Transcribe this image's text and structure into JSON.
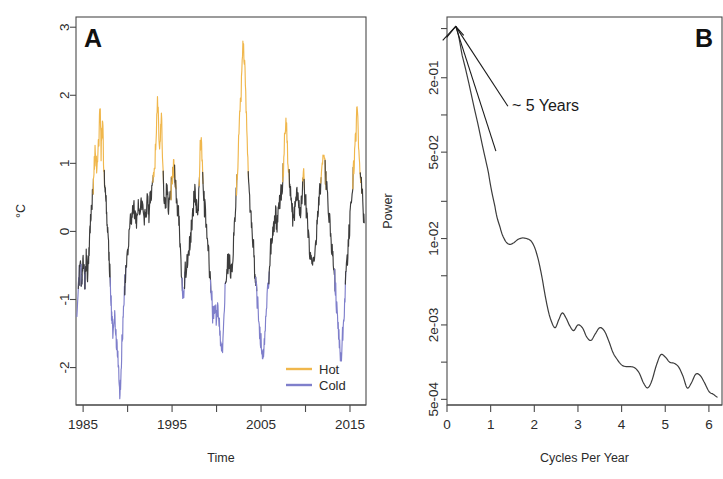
{
  "figure": {
    "background": "#ffffff",
    "width": 723,
    "height": 479
  },
  "panelA": {
    "letter": "A",
    "ylabel": "°C",
    "xlabel": "Time",
    "colors": {
      "neutral": "#3c3c3c",
      "hot": "#F0B74C",
      "cold": "#7F7FCB"
    },
    "legend": {
      "items": [
        {
          "label": "Hot",
          "color": "#F0B74C"
        },
        {
          "label": "Cold",
          "color": "#7F7FCB"
        }
      ]
    },
    "yticks": [
      {
        "value": 3,
        "label": "3"
      },
      {
        "value": 2,
        "label": "2"
      },
      {
        "value": 1,
        "label": "1"
      },
      {
        "value": 0,
        "label": "0"
      },
      {
        "value": -1,
        "label": "-1"
      },
      {
        "value": -2,
        "label": "-2"
      }
    ],
    "xticks": [
      {
        "value": 1985,
        "label": "1985"
      },
      {
        "value": 1990,
        "label": ""
      },
      {
        "value": 1995,
        "label": "1995"
      },
      {
        "value": 2000,
        "label": ""
      },
      {
        "value": 2005,
        "label": "2005"
      },
      {
        "value": 2010,
        "label": ""
      },
      {
        "value": 2015,
        "label": "2015"
      }
    ]
  },
  "panelB": {
    "letter": "B",
    "ylabel": "Power",
    "xlabel": "Cycles Per Year",
    "annotation": "~ 5 Years",
    "color": "#3c3c3c",
    "yticks": [
      {
        "value": 0.5,
        "label": ""
      },
      {
        "value": 0.2,
        "label": "2e-01"
      },
      {
        "value": 0.1,
        "label": ""
      },
      {
        "value": 0.05,
        "label": "5e-02"
      },
      {
        "value": 0.02,
        "label": ""
      },
      {
        "value": 0.01,
        "label": "1e-02"
      },
      {
        "value": 0.005,
        "label": ""
      },
      {
        "value": 0.002,
        "label": "2e-03"
      },
      {
        "value": 0.001,
        "label": ""
      },
      {
        "value": 0.0005,
        "label": "5e-04"
      }
    ],
    "xticks": [
      {
        "value": 0,
        "label": "0"
      },
      {
        "value": 1,
        "label": "1"
      },
      {
        "value": 2,
        "label": "2"
      },
      {
        "value": 3,
        "label": "3"
      },
      {
        "value": 4,
        "label": "4"
      },
      {
        "value": 5,
        "label": "5"
      },
      {
        "value": 6,
        "label": "6"
      }
    ]
  },
  "chart_data": [
    {
      "type": "line",
      "panel": "A",
      "title": "",
      "xlabel": "Time",
      "ylabel": "°C",
      "xlim": [
        1984.2,
        2016.8
      ],
      "ylim": [
        -2.55,
        3.15
      ],
      "grid": false,
      "legend": [
        "Hot",
        "Cold"
      ],
      "legend_position": "bottom-right",
      "description": "Monthly sea-surface-temperature anomaly series; segments above +0.75 °C drawn in Hot orange, segments below -0.75 °C drawn in Cold blue, remainder in dark grey.",
      "thresholds": {
        "hot": 0.75,
        "cold": -0.75
      },
      "x": [
        1984.3,
        1984.5,
        1984.7,
        1984.85,
        1985.0,
        1985.2,
        1985.35,
        1985.5,
        1985.65,
        1985.8,
        1985.95,
        1986.1,
        1986.25,
        1986.4,
        1986.55,
        1986.75,
        1986.9,
        1987.05,
        1987.2,
        1987.35,
        1987.5,
        1987.65,
        1987.8,
        1987.95,
        1988.1,
        1988.25,
        1988.4,
        1988.55,
        1988.7,
        1988.85,
        1989.0,
        1989.15,
        1989.3,
        1989.45,
        1989.6,
        1989.8,
        1990.0,
        1990.2,
        1990.4,
        1990.6,
        1990.8,
        1991.0,
        1991.2,
        1991.4,
        1991.6,
        1991.8,
        1992.0,
        1992.2,
        1992.4,
        1992.6,
        1992.8,
        1993.0,
        1993.2,
        1993.4,
        1993.6,
        1993.8,
        1994.0,
        1994.2,
        1994.4,
        1994.6,
        1994.8,
        1995.0,
        1995.2,
        1995.4,
        1995.6,
        1995.8,
        1996.0,
        1996.2,
        1996.4,
        1996.6,
        1996.8,
        1997.0,
        1997.2,
        1997.4,
        1997.6,
        1997.8,
        1998.0,
        1998.2,
        1998.4,
        1998.6,
        1998.8,
        1999.0,
        1999.2,
        1999.4,
        1999.6,
        1999.8,
        2000.0,
        2000.2,
        2000.4,
        2000.6,
        2000.8,
        2001.0,
        2001.2,
        2001.4,
        2001.6,
        2001.8,
        2002.0,
        2002.2,
        2002.4,
        2002.6,
        2002.8,
        2003.0,
        2003.2,
        2003.4,
        2003.6,
        2003.8,
        2004.0,
        2004.2,
        2004.4,
        2004.6,
        2004.8,
        2005.0,
        2005.2,
        2005.4,
        2005.6,
        2005.8,
        2006.0,
        2006.2,
        2006.4,
        2006.6,
        2006.8,
        2007.0,
        2007.2,
        2007.4,
        2007.6,
        2007.8,
        2008.0,
        2008.2,
        2008.4,
        2008.6,
        2008.8,
        2009.0,
        2009.2,
        2009.4,
        2009.6,
        2009.8,
        2010.0,
        2010.2,
        2010.4,
        2010.6,
        2010.8,
        2011.0,
        2011.2,
        2011.4,
        2011.6,
        2011.8,
        2012.0,
        2012.2,
        2012.4,
        2012.6,
        2012.8,
        2013.0,
        2013.2,
        2013.4,
        2013.6,
        2013.8,
        2014.0,
        2014.2,
        2014.4,
        2014.6,
        2014.8,
        2015.0,
        2015.2,
        2015.4,
        2015.6,
        2015.8,
        2016.0,
        2016.2,
        2016.4,
        2016.6
      ],
      "y": [
        -1.1,
        -0.75,
        -0.55,
        -0.8,
        -0.45,
        -0.7,
        -0.4,
        -0.62,
        -0.3,
        0.05,
        0.3,
        0.62,
        0.95,
        1.15,
        0.95,
        1.3,
        1.72,
        1.2,
        1.55,
        0.85,
        0.55,
        0.3,
        -0.1,
        -0.45,
        -0.9,
        -1.35,
        -1.5,
        -1.3,
        -1.55,
        -1.75,
        -2.1,
        -2.35,
        -1.9,
        -1.4,
        -1.0,
        -0.6,
        -0.3,
        0.0,
        0.2,
        0.4,
        0.3,
        0.15,
        0.35,
        0.2,
        0.45,
        0.3,
        0.2,
        0.45,
        0.32,
        0.55,
        0.7,
        0.88,
        1.35,
        1.9,
        1.2,
        1.6,
        0.75,
        0.4,
        0.6,
        0.35,
        0.55,
        0.7,
        0.95,
        0.6,
        0.35,
        0.2,
        -0.5,
        -1.0,
        -0.75,
        -0.55,
        -0.35,
        -0.2,
        0.1,
        0.35,
        0.55,
        0.3,
        0.5,
        1.3,
        0.95,
        0.45,
        0.2,
        -0.2,
        -0.55,
        -0.85,
        -1.25,
        -1.05,
        -1.3,
        -1.1,
        -1.55,
        -1.7,
        -1.25,
        -0.8,
        -0.5,
        -0.4,
        -0.55,
        -0.45,
        0.1,
        0.5,
        1.0,
        1.7,
        2.15,
        2.67,
        2.3,
        1.45,
        0.7,
        0.35,
        0.0,
        -0.35,
        -0.7,
        -1.05,
        -1.4,
        -1.7,
        -1.9,
        -1.55,
        -1.15,
        -0.8,
        -0.45,
        -0.15,
        0.05,
        0.25,
        0.15,
        0.35,
        0.55,
        0.75,
        1.2,
        1.65,
        1.1,
        0.7,
        0.45,
        0.2,
        0.35,
        0.6,
        0.45,
        0.25,
        0.55,
        0.75,
        0.4,
        0.15,
        -0.15,
        -0.4,
        -0.55,
        -0.35,
        -0.1,
        0.25,
        0.55,
        0.85,
        1.2,
        0.9,
        0.6,
        0.3,
        0.05,
        -0.25,
        -0.55,
        -0.9,
        -1.35,
        -1.6,
        -1.85,
        -1.45,
        -1.0,
        -0.55,
        -0.2,
        0.2,
        0.55,
        0.9,
        1.35,
        1.72,
        1.2,
        0.85,
        0.5,
        0.25
      ]
    },
    {
      "type": "line",
      "panel": "B",
      "title": "",
      "xlabel": "Cycles Per Year",
      "ylabel": "Power",
      "xlim": [
        0,
        6.3
      ],
      "ylim": [
        0.00045,
        0.62
      ],
      "yscale": "log",
      "grid": false,
      "annotations": [
        {
          "text": "~ 5 Years",
          "x": 1.35,
          "y": 0.12
        }
      ],
      "description": "Smoothed spectral density of the temperature series; dominant low-frequency peak near 0.2 cycles per year (~5 year period).",
      "x": [
        0.2,
        0.35,
        0.55,
        0.75,
        0.95,
        1.1,
        1.22,
        1.32,
        1.42,
        1.52,
        1.62,
        1.72,
        1.82,
        1.92,
        2.0,
        2.08,
        2.16,
        2.24,
        2.32,
        2.4,
        2.48,
        2.56,
        2.64,
        2.72,
        2.8,
        2.9,
        3.0,
        3.1,
        3.2,
        3.3,
        3.4,
        3.5,
        3.6,
        3.7,
        3.8,
        3.9,
        4.0,
        4.1,
        4.2,
        4.3,
        4.4,
        4.5,
        4.6,
        4.7,
        4.8,
        4.9,
        5.0,
        5.1,
        5.2,
        5.3,
        5.4,
        5.5,
        5.6,
        5.7,
        5.8,
        5.9,
        6.0,
        6.1,
        6.2
      ],
      "y": [
        0.52,
        0.3,
        0.15,
        0.072,
        0.034,
        0.018,
        0.0122,
        0.0098,
        0.009,
        0.0092,
        0.0098,
        0.0101,
        0.01,
        0.0096,
        0.0086,
        0.007,
        0.0052,
        0.0036,
        0.0026,
        0.0021,
        0.0019,
        0.0022,
        0.0025,
        0.0023,
        0.002,
        0.0018,
        0.002,
        0.0019,
        0.0016,
        0.0015,
        0.0017,
        0.0019,
        0.0018,
        0.0015,
        0.0012,
        0.00105,
        0.00095,
        0.00092,
        0.00092,
        0.0009,
        0.00082,
        0.00068,
        0.00062,
        0.00072,
        0.00095,
        0.00115,
        0.0011,
        0.001,
        0.00098,
        0.00092,
        0.00078,
        0.00062,
        0.00068,
        0.0008,
        0.00078,
        0.00068,
        0.00058,
        0.00055,
        0.00052
      ]
    }
  ]
}
